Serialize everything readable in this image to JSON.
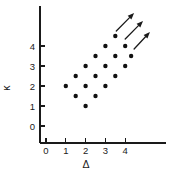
{
  "chart_data": {
    "type": "scatter",
    "title": "",
    "xlabel": "Δ",
    "ylabel": "κ",
    "xlim": [
      -0.6,
      5.4
    ],
    "ylim": [
      -0.9,
      5.1
    ],
    "grid": false,
    "legend": null,
    "xticks": [
      0,
      1,
      2,
      3,
      4
    ],
    "xtick_labels": [
      "0",
      "1",
      "2",
      "3",
      "4"
    ],
    "yticks": [
      0,
      1,
      2,
      3,
      4
    ],
    "ytick_labels": [
      "0",
      "1",
      "2",
      "3",
      "4"
    ],
    "marker": "filled-circle",
    "marker_color": "#111111",
    "points": [
      {
        "x": 1.0,
        "y": 2.0
      },
      {
        "x": 1.5,
        "y": 2.5
      },
      {
        "x": 1.5,
        "y": 1.5
      },
      {
        "x": 2.0,
        "y": 3.0
      },
      {
        "x": 2.0,
        "y": 2.0
      },
      {
        "x": 2.0,
        "y": 1.0
      },
      {
        "x": 2.5,
        "y": 3.5
      },
      {
        "x": 2.5,
        "y": 2.5
      },
      {
        "x": 2.5,
        "y": 1.5
      },
      {
        "x": 3.0,
        "y": 4.0
      },
      {
        "x": 3.0,
        "y": 3.0
      },
      {
        "x": 3.0,
        "y": 2.0
      },
      {
        "x": 3.5,
        "y": 4.5
      },
      {
        "x": 3.5,
        "y": 3.5
      },
      {
        "x": 3.5,
        "y": 2.5
      },
      {
        "x": 4.0,
        "y": 4.0
      },
      {
        "x": 4.0,
        "y": 3.0
      },
      {
        "x": 4.3,
        "y": 3.5
      }
    ],
    "annotations": [
      {
        "kind": "arrow",
        "label": "trend-arrow-upper",
        "x_start": 3.55,
        "y_start": 4.75,
        "x_end": 4.45,
        "y_end": 5.65
      },
      {
        "kind": "arrow",
        "label": "trend-arrow-middle",
        "x_start": 4.0,
        "y_start": 4.35,
        "x_end": 4.9,
        "y_end": 5.25
      },
      {
        "kind": "arrow",
        "label": "trend-arrow-lower",
        "x_start": 4.45,
        "y_start": 3.85,
        "x_end": 5.25,
        "y_end": 4.7
      }
    ]
  },
  "axes": {
    "x_axis_label": "Δ",
    "y_axis_label": "κ"
  }
}
